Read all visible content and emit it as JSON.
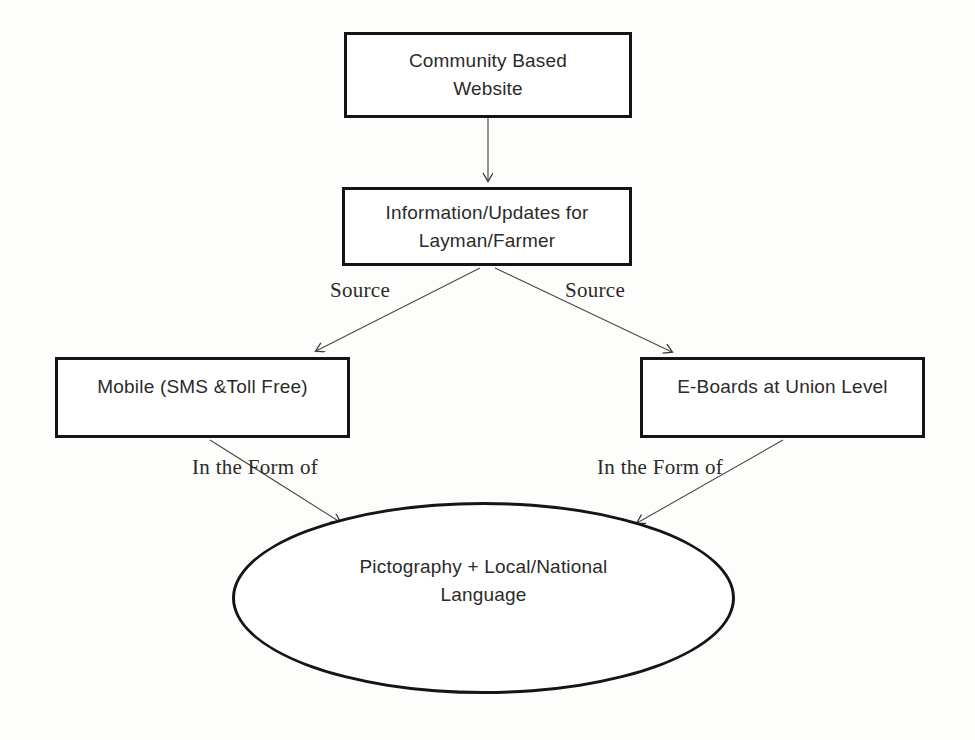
{
  "diagram": {
    "background_color": "#fdfdfb",
    "stroke_color": "#151515",
    "text_color": "#2b2b2b",
    "nodes": [
      {
        "id": "website",
        "shape": "rect",
        "label": "Community Based\nWebsite",
        "line1": "Community Based",
        "line2": "Website"
      },
      {
        "id": "info",
        "shape": "rect",
        "label": "Information/Updates for\nLayman/Farmer",
        "line1": "Information/Updates for",
        "line2": "Layman/Farmer"
      },
      {
        "id": "mobile",
        "shape": "rect",
        "label": "Mobile (SMS &Toll Free)",
        "line1": "Mobile (SMS &Toll Free)",
        "line2": ""
      },
      {
        "id": "eboards",
        "shape": "rect",
        "label": "E-Boards at Union Level",
        "line1": "E-Boards at Union Level",
        "line2": ""
      },
      {
        "id": "output",
        "shape": "ellipse",
        "label": "Pictography + Local/National\nLanguage",
        "line1": "Pictography + Local/National",
        "line2": "Language"
      }
    ],
    "edges": [
      {
        "from": "website",
        "to": "info",
        "label": ""
      },
      {
        "from": "info",
        "to": "mobile",
        "label": "Source"
      },
      {
        "from": "info",
        "to": "eboards",
        "label": "Source"
      },
      {
        "from": "mobile",
        "to": "output",
        "label": "In the Form of"
      },
      {
        "from": "eboards",
        "to": "output",
        "label": "In the Form of"
      }
    ],
    "labels": {
      "source_left": "Source",
      "source_right": "Source",
      "form_left": "In the Form of",
      "form_right": "In the Form of"
    }
  }
}
